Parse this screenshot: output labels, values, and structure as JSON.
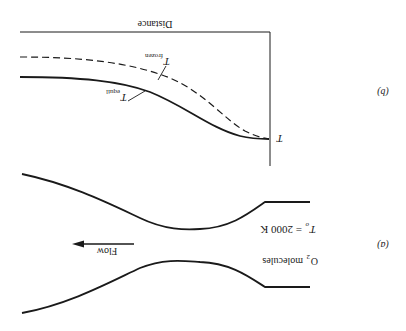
{
  "figure": {
    "orientation": "rotated 180 degrees",
    "panel_b": {
      "label": "(b)",
      "x_axis_label": "Distance",
      "y_axis_label": "T",
      "curves": [
        {
          "name": "T frozen",
          "symbol": "T",
          "subscript": "frozen",
          "style": "dashed"
        },
        {
          "name": "T equil",
          "symbol": "T",
          "subscript": "equil",
          "style": "solid"
        }
      ]
    },
    "panel_a": {
      "label": "(a)",
      "flow_label": "Flow",
      "stagnation_temp": {
        "symbol": "T",
        "subscript": "o",
        "value": "= 2000 K"
      },
      "gas": {
        "formula": "O",
        "subscript": "2",
        "text": "molecules"
      }
    },
    "colors": {
      "ink": "#1a1a1a",
      "background": "#ffffff"
    }
  }
}
